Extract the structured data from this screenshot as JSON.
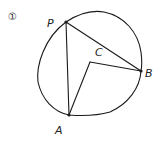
{
  "diagram": {
    "problem_number": "①",
    "points": {
      "P": {
        "label": "P",
        "x": 66,
        "y": 22
      },
      "B": {
        "label": "B",
        "x": 141,
        "y": 71
      },
      "A": {
        "label": "A",
        "x": 69,
        "y": 115
      },
      "C": {
        "label": "C",
        "x": 90,
        "y": 62
      }
    },
    "segments": [
      "PB",
      "PA",
      "AC",
      "CB"
    ],
    "shape": "circle through P, B, A with center C"
  }
}
